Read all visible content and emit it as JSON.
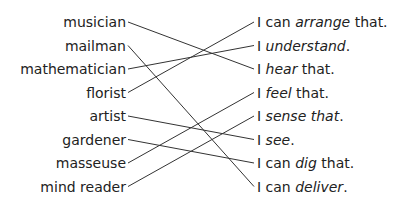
{
  "diagram": {
    "type": "matching",
    "left_items": [
      "musician",
      "mailman",
      "mathematician",
      "florist",
      "artist",
      "gardener",
      "masseuse",
      "mind reader"
    ],
    "right_items": [
      {
        "parts": [
          {
            "t": "I can "
          },
          {
            "t": "arrange",
            "i": true
          },
          {
            "t": " that."
          }
        ]
      },
      {
        "parts": [
          {
            "t": "I "
          },
          {
            "t": "understand",
            "i": true
          },
          {
            "t": "."
          }
        ]
      },
      {
        "parts": [
          {
            "t": "I "
          },
          {
            "t": "hear",
            "i": true
          },
          {
            "t": " that."
          }
        ]
      },
      {
        "parts": [
          {
            "t": "I "
          },
          {
            "t": "feel",
            "i": true
          },
          {
            "t": " that."
          }
        ]
      },
      {
        "parts": [
          {
            "t": "I "
          },
          {
            "t": "sense that",
            "i": true
          },
          {
            "t": "."
          }
        ]
      },
      {
        "parts": [
          {
            "t": "I "
          },
          {
            "t": "see",
            "i": true
          },
          {
            "t": "."
          }
        ]
      },
      {
        "parts": [
          {
            "t": "I can "
          },
          {
            "t": "dig",
            "i": true
          },
          {
            "t": " that."
          }
        ]
      },
      {
        "parts": [
          {
            "t": "I can "
          },
          {
            "t": "deliver",
            "i": true
          },
          {
            "t": "."
          }
        ]
      }
    ],
    "connections": [
      [
        0,
        2
      ],
      [
        1,
        7
      ],
      [
        2,
        1
      ],
      [
        3,
        0
      ],
      [
        4,
        5
      ],
      [
        5,
        6
      ],
      [
        6,
        3
      ],
      [
        7,
        4
      ]
    ],
    "line_color": "#333333"
  }
}
